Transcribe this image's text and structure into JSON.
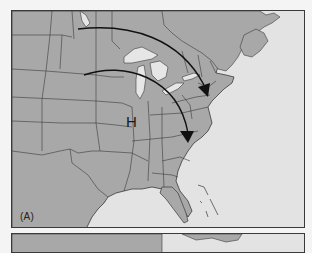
{
  "figure": {
    "panels": [
      {
        "label": "(A)",
        "pressure_center": {
          "symbol": "H",
          "meaning": "high pressure"
        },
        "arrows": [
          {
            "name": "northern-track",
            "direction": "west-to-east then southeast"
          },
          {
            "name": "southern-track",
            "direction": "west-to-east then southeast"
          }
        ]
      },
      {
        "label": ""
      }
    ],
    "colors": {
      "land": "#a8a8a8",
      "water": "#e3e3e3",
      "lakes": "#e6e6e6",
      "borders": "#3a3a3a",
      "arrows": "#111111"
    }
  }
}
